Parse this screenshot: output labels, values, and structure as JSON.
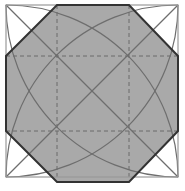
{
  "diagram": {
    "type": "geometric-construction",
    "square": {
      "x": 6,
      "y": 5,
      "size": 172
    },
    "octagon_points": [
      [
        57,
        5
      ],
      [
        129,
        5
      ],
      [
        178,
        56
      ],
      [
        178,
        131
      ],
      [
        129,
        182
      ],
      [
        57,
        182
      ],
      [
        6,
        131
      ],
      [
        6,
        56
      ]
    ],
    "dashed_lines": {
      "x": [
        57,
        129
      ],
      "y": [
        56,
        131
      ]
    },
    "arc_radius": 172,
    "colors": {
      "background": "#ffffff",
      "octagon_fill": "#a9a9a9",
      "octagon_stroke": "#333333",
      "square_stroke": "#9a9a9a",
      "construction_line": "#6e6e6e",
      "dashed_line": "#6a6a6a"
    }
  }
}
